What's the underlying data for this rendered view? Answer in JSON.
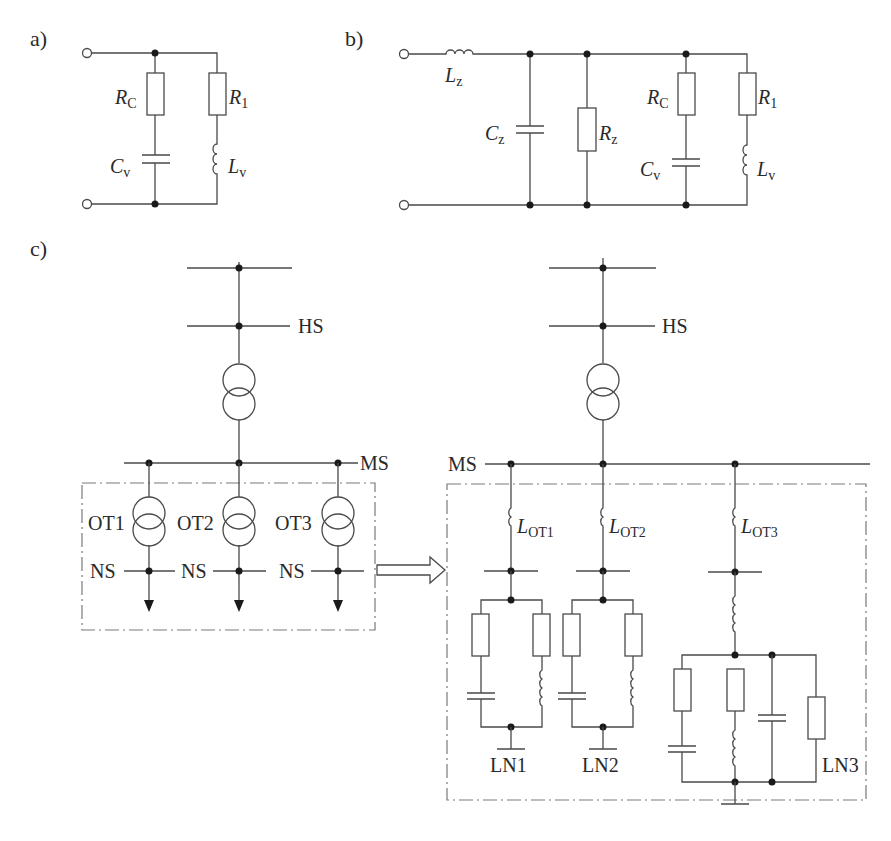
{
  "panels": {
    "a": {
      "label": "a)",
      "components": {
        "rc": "R",
        "rc_sub": "C",
        "r1": "R",
        "r1_sub": "1",
        "cv": "C",
        "cv_sub": "v",
        "lv": "L",
        "lv_sub": "v"
      }
    },
    "b": {
      "label": "b)",
      "components": {
        "lz": "L",
        "lz_sub": "z",
        "cz": "C",
        "cz_sub": "z",
        "rz": "R",
        "rz_sub": "z",
        "rc": "R",
        "rc_sub": "C",
        "r1": "R",
        "r1_sub": "1",
        "cv": "C",
        "cv_sub": "v",
        "lv": "L",
        "lv_sub": "v"
      }
    },
    "c": {
      "label": "c)",
      "left": {
        "hs": "HS",
        "ms": "MS",
        "transformers": [
          "OT1",
          "OT2",
          "OT3"
        ],
        "ns": [
          "NS",
          "NS",
          "NS"
        ]
      },
      "right": {
        "hs": "HS",
        "ms": "MS",
        "inductors": [
          {
            "main": "L",
            "sub": "OT1"
          },
          {
            "main": "L",
            "sub": "OT2"
          },
          {
            "main": "L",
            "sub": "OT3"
          }
        ],
        "loads": [
          "LN1",
          "LN2",
          "LN3"
        ]
      }
    }
  },
  "colors": {
    "wire": "#4a4a4a",
    "node": "#1a1a1a",
    "dashed_box": "#7a7a7a",
    "background": "#ffffff"
  }
}
